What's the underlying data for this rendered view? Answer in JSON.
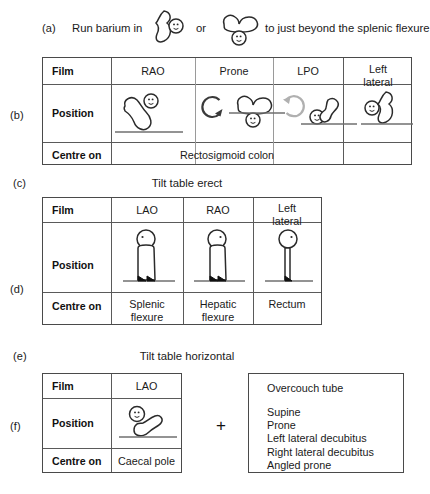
{
  "figure": {
    "steps": {
      "a": "(a)",
      "b": "(b)",
      "c": "(c)",
      "d": "(d)",
      "e": "(e)",
      "f": "(f)"
    },
    "step_a": {
      "text_before": "Run barium in",
      "text_middle": "or",
      "text_after": "to just beyond the splenic flexure",
      "icon_1": "patient-lateral-supine-icon",
      "icon_2": "patient-prone-icon"
    },
    "step_c": {
      "note": "Tilt table erect"
    },
    "step_e": {
      "note": "Tilt table horizontal"
    },
    "table_b": {
      "row_labels": {
        "film": "Film",
        "position": "Position",
        "centre": "Centre on"
      },
      "columns": [
        {
          "film": "RAO",
          "position_icon": "patient-rao-recumbent-icon"
        },
        {
          "film": "Prone",
          "position_icon": "patient-prone-recumbent-icon"
        },
        {
          "film": "LPO",
          "position_icon": "patient-lpo-recumbent-icon"
        },
        {
          "film": "Left\nlateral",
          "position_icon": "patient-left-lateral-recumbent-icon"
        }
      ],
      "centre_merged": "Rectosigmoid colon",
      "centre_lateral": "",
      "arrows": [
        {
          "name": "rotate-clockwise-arrow",
          "color": "#3a3a3a"
        },
        {
          "name": "rotate-counterclockwise-arrow",
          "color": "#b0b0b0"
        }
      ]
    },
    "table_d": {
      "row_labels": {
        "film": "Film",
        "position": "Position",
        "centre": "Centre on"
      },
      "columns": [
        {
          "film": "LAO",
          "position_icon": "patient-standing-lao-icon",
          "centre": "Splenic\nflexure"
        },
        {
          "film": "RAO",
          "position_icon": "patient-standing-rao-icon",
          "centre": "Hepatic\nflexure"
        },
        {
          "film": "Left\nlateral",
          "position_icon": "patient-standing-left-lateral-icon",
          "centre": "Rectum"
        }
      ]
    },
    "table_f": {
      "row_labels": {
        "film": "Film",
        "position": "Position",
        "centre": "Centre on"
      },
      "columns": [
        {
          "film": "LAO",
          "position_icon": "patient-lao-recumbent-icon",
          "centre": "Caecal pole"
        }
      ],
      "plus": "+"
    },
    "overcouch_box": {
      "title": "Overcouch tube",
      "items": "Supine\nProne\nLeft lateral decubitus\nRight lateral decubitus\nAngled prone"
    },
    "colors": {
      "ink": "#2b2b2b",
      "border": "#4a4a4a",
      "arrow_dark": "#3a3a3a",
      "arrow_light": "#b0b0b0",
      "background": "#ffffff"
    }
  }
}
